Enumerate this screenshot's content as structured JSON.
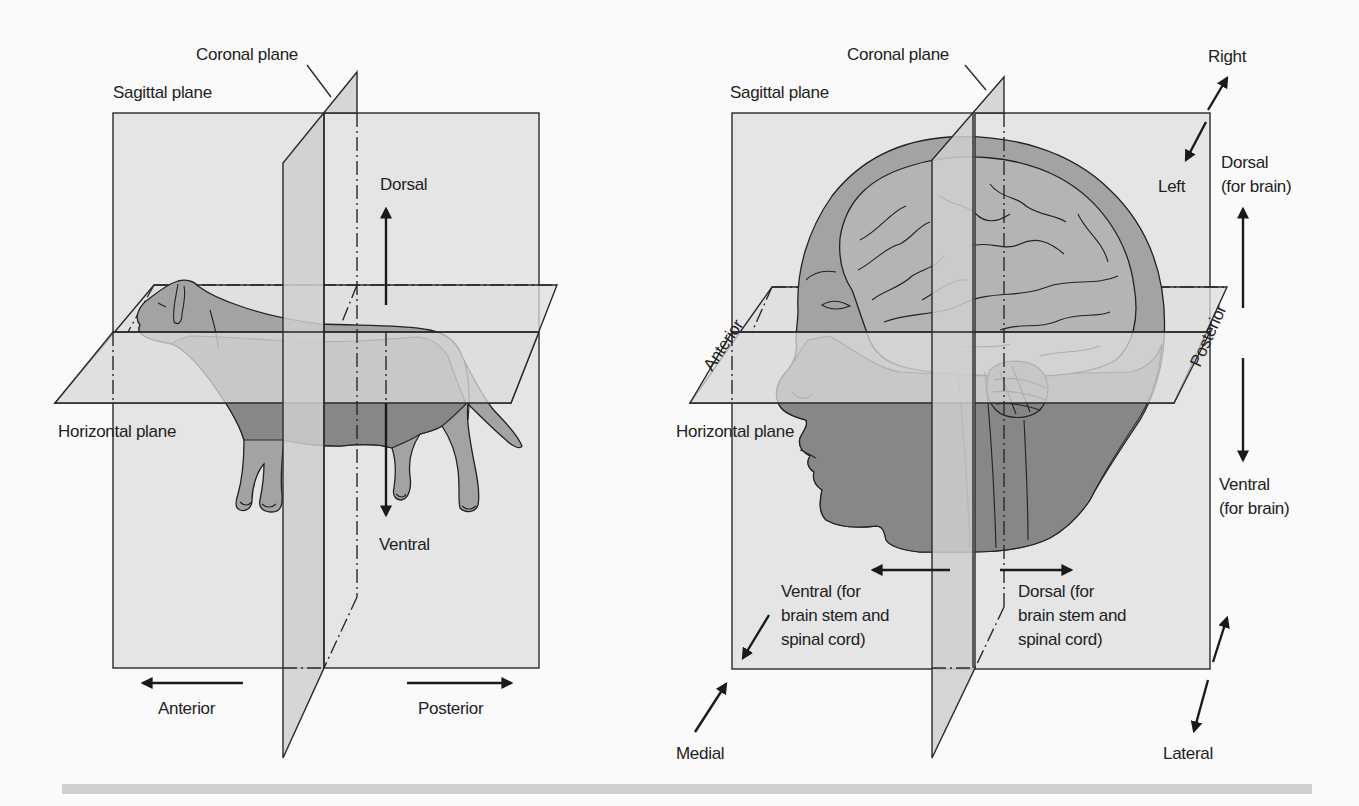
{
  "figures": {
    "dog": {
      "labels": {
        "coronal_plane": "Coronal plane",
        "sagittal_plane": "Sagittal plane",
        "horizontal_plane": "Horizontal plane",
        "dorsal": "Dorsal",
        "ventral": "Ventral",
        "anterior": "Anterior",
        "posterior": "Posterior"
      }
    },
    "human": {
      "labels": {
        "coronal_plane": "Coronal plane",
        "sagittal_plane": "Sagittal plane",
        "horizontal_plane": "Horizontal plane",
        "right": "Right",
        "left": "Left",
        "dorsal_brain_line1": "Dorsal",
        "dorsal_brain_line2": "(for brain)",
        "ventral_brain_line1": "Ventral",
        "ventral_brain_line2": "(for brain)",
        "anterior": "Anterior",
        "posterior": "Posterior",
        "ventral_stem_line1": "Ventral (for",
        "ventral_stem_line2": "brain stem and",
        "ventral_stem_line3": "spinal cord)",
        "dorsal_stem_line1": "Dorsal (for",
        "dorsal_stem_line2": "brain stem and",
        "dorsal_stem_line3": "spinal cord)",
        "medial": "Medial",
        "lateral": "Lateral"
      }
    }
  },
  "colors": {
    "plane_fill": "#dedede",
    "body_fill": "#a3a3a3",
    "body_dark": "#858585",
    "ink": "#222222",
    "background": "#fafafa"
  }
}
